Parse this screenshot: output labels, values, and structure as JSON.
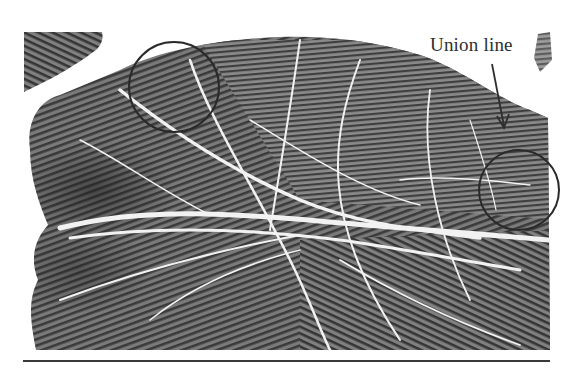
{
  "figure": {
    "annotation": {
      "label": "Union line",
      "arrow": {
        "from": [
          490,
          64
        ],
        "to": [
          505,
          128
        ]
      }
    },
    "highlight_circles": [
      {
        "name": "hypothenar-top-circle",
        "cx": 174,
        "cy": 87,
        "r": 45
      },
      {
        "name": "right-edge-circle",
        "cx": 519,
        "cy": 190,
        "r": 40
      }
    ],
    "colors": {
      "background": "#ffffff",
      "ridge_dark": "#3c3c3c",
      "ridge_mid": "#6a6a6a",
      "crease": "#f2f2f2",
      "circle_stroke": "#2a2a2a",
      "text": "#2e2e2e",
      "rule": "#3a3a3a"
    }
  }
}
